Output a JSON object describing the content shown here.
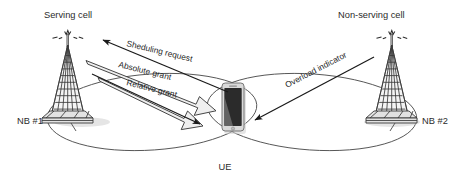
{
  "diagram": {
    "title_left": "Serving cell",
    "title_right": "Non-serving cell",
    "node_left_label": "NB #1",
    "node_right_label": "NB #2",
    "ue_label": "UE",
    "arrows": [
      {
        "id": "scheduling-request",
        "label": "Sheduling request",
        "direction": "ue-to-serving-cell",
        "style": "thin-solid"
      },
      {
        "id": "absolute-grant",
        "label": "Absolute grant",
        "direction": "serving-cell-to-ue",
        "style": "hollow-block"
      },
      {
        "id": "relative-grant",
        "label": "Relative grant",
        "direction": "serving-cell-to-ue",
        "style": "hollow-block"
      },
      {
        "id": "overload-indicator",
        "label": "Overload indicator",
        "direction": "non-serving-cell-to-ue",
        "style": "thin-solid"
      }
    ],
    "colors": {
      "background": "#ffffff",
      "line": "#1a1a1a",
      "coverage_outline": "#4a4a4a",
      "tower_fill": "#f4f4f4",
      "hollow_arrow_fill": "#efefef",
      "phone_body": "#d8d8d8",
      "phone_screen": "#2a2a2a",
      "text": "#1f1f1f"
    }
  }
}
